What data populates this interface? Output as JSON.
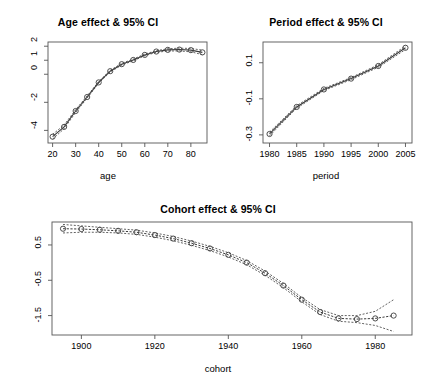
{
  "figure": {
    "width": 436,
    "height": 390,
    "background": "#ffffff",
    "line_color": "#3a3a3a",
    "axis_color": "#555555"
  },
  "panels": {
    "age": {
      "title": "Age effect & 95% CI",
      "xlabel": "age",
      "ylabel": ""
    },
    "period": {
      "title": "Period effect & 95% CI",
      "xlabel": "period",
      "ylabel": ""
    },
    "cohort": {
      "title": "Cohort effect & 95% CI",
      "xlabel": "cohort",
      "ylabel": ""
    }
  },
  "chart_data": [
    {
      "type": "line",
      "id": "age-effect",
      "title": "Age effect & 95% CI",
      "xlabel": "age",
      "ylabel": "",
      "xlim": [
        18,
        87
      ],
      "ylim": [
        -4.9,
        2.3
      ],
      "xticks": [
        20,
        30,
        40,
        50,
        60,
        70,
        80
      ],
      "yticks": [
        -4,
        -2,
        0,
        1,
        2
      ],
      "grid": false,
      "legend": null,
      "x": [
        20,
        25,
        30,
        35,
        40,
        45,
        50,
        55,
        60,
        65,
        70,
        75,
        80,
        85
      ],
      "values": [
        -4.45,
        -3.75,
        -2.62,
        -1.62,
        -0.58,
        0.22,
        0.72,
        1.02,
        1.38,
        1.62,
        1.74,
        1.76,
        1.72,
        1.56
      ],
      "ci_lower": [
        -4.62,
        -3.88,
        -2.72,
        -1.7,
        -0.64,
        0.16,
        0.66,
        0.96,
        1.32,
        1.56,
        1.66,
        1.66,
        1.6,
        1.4
      ],
      "ci_upper": [
        -4.28,
        -3.62,
        -2.52,
        -1.54,
        -0.52,
        0.28,
        0.78,
        1.08,
        1.44,
        1.68,
        1.82,
        1.86,
        1.84,
        1.72
      ]
    },
    {
      "type": "line",
      "id": "period-effect",
      "title": "Period effect & 95% CI",
      "xlabel": "period",
      "ylabel": "",
      "xlim": [
        1978.8,
        2006.2
      ],
      "ylim": [
        -0.345,
        0.215
      ],
      "xticks": [
        1980,
        1985,
        1990,
        1995,
        2000,
        2005
      ],
      "yticks": [
        -0.3,
        -0.1,
        0.1
      ],
      "grid": false,
      "legend": null,
      "x": [
        1980,
        1985,
        1990,
        1995,
        2000,
        2005
      ],
      "values": [
        -0.295,
        -0.145,
        -0.048,
        0.012,
        0.082,
        0.183
      ],
      "ci_lower": [
        -0.305,
        -0.152,
        -0.054,
        0.006,
        0.075,
        0.173
      ],
      "ci_upper": [
        -0.285,
        -0.138,
        -0.042,
        0.018,
        0.089,
        0.193
      ]
    },
    {
      "type": "line",
      "id": "cohort-effect",
      "title": "Cohort effect & 95% CI",
      "xlabel": "cohort",
      "ylabel": "",
      "xlim": [
        1892,
        1990
      ],
      "ylim": [
        -2.05,
        1.15
      ],
      "xticks": [
        1900,
        1920,
        1940,
        1960,
        1980
      ],
      "yticks": [
        -1.5,
        -0.5,
        0.5
      ],
      "grid": false,
      "legend": null,
      "x": [
        1895,
        1900,
        1905,
        1910,
        1915,
        1920,
        1925,
        1930,
        1935,
        1940,
        1945,
        1950,
        1955,
        1960,
        1965,
        1970,
        1975,
        1980,
        1985
      ],
      "values": [
        0.96,
        0.95,
        0.93,
        0.9,
        0.86,
        0.78,
        0.68,
        0.55,
        0.4,
        0.22,
        0.0,
        -0.3,
        -0.65,
        -1.05,
        -1.4,
        -1.58,
        -1.6,
        -1.58,
        -1.5
      ],
      "ci_lower": [
        0.84,
        0.86,
        0.86,
        0.84,
        0.8,
        0.72,
        0.62,
        0.49,
        0.34,
        0.16,
        -0.06,
        -0.36,
        -0.71,
        -1.11,
        -1.47,
        -1.66,
        -1.7,
        -1.78,
        -1.95
      ],
      "ci_upper": [
        1.08,
        1.04,
        1.0,
        0.96,
        0.92,
        0.84,
        0.74,
        0.61,
        0.46,
        0.28,
        0.06,
        -0.24,
        -0.59,
        -0.99,
        -1.33,
        -1.5,
        -1.5,
        -1.38,
        -1.05
      ]
    }
  ]
}
